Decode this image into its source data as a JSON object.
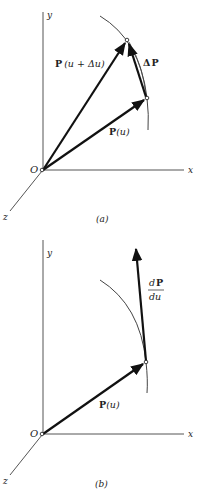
{
  "figure_a": {
    "caption": "(a)",
    "axis_labels": {
      "x": "x",
      "y": "y",
      "z": "z",
      "origin": "O"
    },
    "vectors": [
      {
        "name": "P(u+Δu)",
        "label_bold": "P",
        "label_rest": "(u + Δu)"
      },
      {
        "name": "P(u)",
        "label_bold": "P",
        "label_rest": "(u)"
      },
      {
        "name": "ΔP",
        "label_prefix": "Δ",
        "label_bold": "P"
      }
    ]
  },
  "figure_b": {
    "caption": "(b)",
    "axis_labels": {
      "x": "x",
      "y": "y",
      "z": "z",
      "origin": "O"
    },
    "vectors": [
      {
        "name": "P(u)",
        "label_bold": "P",
        "label_rest": "(u)"
      },
      {
        "name": "dP/du",
        "numerator_d": "d",
        "numerator_bold": "P",
        "denominator": "du"
      }
    ]
  },
  "colors": {
    "ink": "#111111",
    "axis": "#555555",
    "curve": "#444444"
  }
}
